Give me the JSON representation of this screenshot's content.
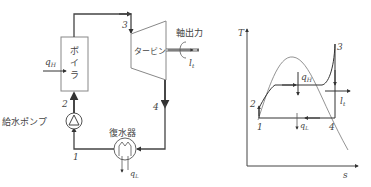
{
  "schematic": {
    "boiler_label": [
      "ボ",
      "イ",
      "ラ"
    ],
    "turbine_label": "タービン",
    "shaft_output_label": "軸出力",
    "pump_label": "給水ポンプ",
    "condenser_label": "復水器",
    "heat_in_label": "q",
    "heat_in_sub": "H",
    "heat_out_label": "q",
    "heat_out_sub": "L",
    "work_label": "l",
    "work_sub": "t",
    "points": {
      "p1": "1",
      "p2": "2",
      "p3": "3",
      "p4": "4"
    }
  },
  "ts_diagram": {
    "y_axis_label": "T",
    "x_axis_label": "s",
    "heat_in_label": "q",
    "heat_in_sub": "H",
    "heat_out_label": "q",
    "heat_out_sub": "L",
    "work_label": "l",
    "work_sub": "t",
    "points": {
      "p1": "1",
      "p2": "2",
      "p3": "3",
      "p4": "4"
    }
  },
  "colors": {
    "line": "#555555",
    "thin": "#777777",
    "text": "#444444"
  }
}
